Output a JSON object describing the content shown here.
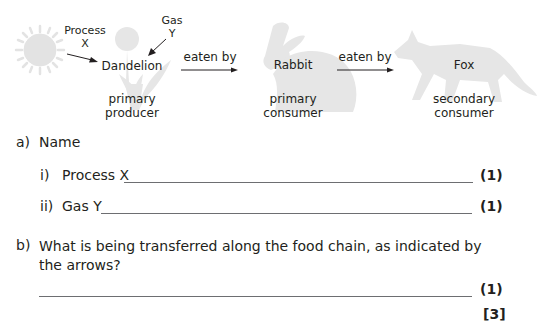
{
  "diagram": {
    "organisms": [
      {
        "name": "Dandelion",
        "role_line1": "primary",
        "role_line2": "producer"
      },
      {
        "name": "Rabbit",
        "role_line1": "primary",
        "role_line2": "consumer"
      },
      {
        "name": "Fox",
        "role_line1": "secondary",
        "role_line2": "consumer"
      }
    ],
    "process_label_line1": "Process",
    "process_label_line2": "X",
    "gas_label_line1": "Gas",
    "gas_label_line2": "Y",
    "arrow_labels": [
      "eaten by",
      "eaten by"
    ],
    "silhouette_color": "#e3e3e3"
  },
  "questions": {
    "a": {
      "label": "a)",
      "prompt": "Name",
      "parts": [
        {
          "label": "i)",
          "text": "Process X",
          "marks": "(1)"
        },
        {
          "label": "ii)",
          "text": "Gas Y",
          "marks": "(1)"
        }
      ]
    },
    "b": {
      "label": "b)",
      "prompt_line1": "What is being transferred along the food chain, as indicated by",
      "prompt_line2": "the arrows?",
      "marks": "(1)"
    },
    "total_marks": "[3]"
  }
}
